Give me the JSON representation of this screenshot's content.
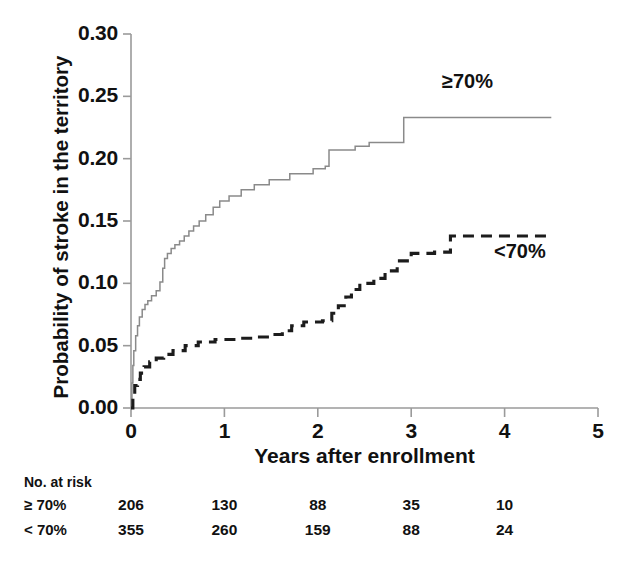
{
  "chart_data": {
    "type": "line",
    "subtype": "kaplan-meier-step",
    "title": "",
    "xlabel": "Years after enrollment",
    "ylabel": "Probability of stroke in the territory",
    "xlim": [
      0,
      5
    ],
    "ylim": [
      0.0,
      0.3
    ],
    "xticks": [
      "0",
      "1",
      "2",
      "3",
      "4",
      "5"
    ],
    "xtick_values": [
      0,
      1,
      2,
      3,
      4,
      5
    ],
    "yticks": [
      "0.00",
      "0.05",
      "0.10",
      "0.15",
      "0.20",
      "0.25",
      "0.30"
    ],
    "ytick_values": [
      0.0,
      0.05,
      0.1,
      0.15,
      0.2,
      0.25,
      0.3
    ],
    "grid": false,
    "legend_position": "in-plot-annotations",
    "series": [
      {
        "name": "≥70%",
        "label": "≥70%",
        "style": "solid",
        "color": "#8a8a8a",
        "annotation_label": "≥70%",
        "points": [
          [
            0.0,
            0.0
          ],
          [
            0.01,
            0.02
          ],
          [
            0.02,
            0.034
          ],
          [
            0.03,
            0.046
          ],
          [
            0.05,
            0.058
          ],
          [
            0.07,
            0.066
          ],
          [
            0.09,
            0.073
          ],
          [
            0.12,
            0.079
          ],
          [
            0.15,
            0.083
          ],
          [
            0.18,
            0.086
          ],
          [
            0.22,
            0.09
          ],
          [
            0.27,
            0.094
          ],
          [
            0.31,
            0.101
          ],
          [
            0.34,
            0.112
          ],
          [
            0.36,
            0.12
          ],
          [
            0.39,
            0.124
          ],
          [
            0.43,
            0.128
          ],
          [
            0.47,
            0.131
          ],
          [
            0.52,
            0.134
          ],
          [
            0.57,
            0.138
          ],
          [
            0.62,
            0.142
          ],
          [
            0.67,
            0.146
          ],
          [
            0.73,
            0.15
          ],
          [
            0.8,
            0.155
          ],
          [
            0.88,
            0.161
          ],
          [
            0.95,
            0.166
          ],
          [
            1.05,
            0.17
          ],
          [
            1.18,
            0.175
          ],
          [
            1.32,
            0.179
          ],
          [
            1.48,
            0.183
          ],
          [
            1.7,
            0.188
          ],
          [
            1.95,
            0.192
          ],
          [
            2.08,
            0.194
          ],
          [
            2.12,
            0.207
          ],
          [
            2.4,
            0.21
          ],
          [
            2.55,
            0.213
          ],
          [
            2.92,
            0.233
          ],
          [
            4.5,
            0.233
          ]
        ]
      },
      {
        "name": "<70%",
        "label": "<70%",
        "style": "dashed",
        "color": "#1c1c1c",
        "annotation_label": "<70%",
        "points": [
          [
            0.0,
            0.0
          ],
          [
            0.02,
            0.01
          ],
          [
            0.04,
            0.018
          ],
          [
            0.07,
            0.023
          ],
          [
            0.1,
            0.028
          ],
          [
            0.14,
            0.033
          ],
          [
            0.2,
            0.037
          ],
          [
            0.27,
            0.04
          ],
          [
            0.35,
            0.043
          ],
          [
            0.45,
            0.046
          ],
          [
            0.58,
            0.05
          ],
          [
            0.72,
            0.053
          ],
          [
            0.9,
            0.055
          ],
          [
            1.15,
            0.056
          ],
          [
            1.35,
            0.057
          ],
          [
            1.52,
            0.059
          ],
          [
            1.62,
            0.062
          ],
          [
            1.72,
            0.066
          ],
          [
            1.85,
            0.069
          ],
          [
            2.05,
            0.07
          ],
          [
            2.15,
            0.076
          ],
          [
            2.22,
            0.082
          ],
          [
            2.3,
            0.089
          ],
          [
            2.36,
            0.095
          ],
          [
            2.45,
            0.1
          ],
          [
            2.6,
            0.104
          ],
          [
            2.72,
            0.11
          ],
          [
            2.85,
            0.118
          ],
          [
            3.0,
            0.124
          ],
          [
            3.25,
            0.125
          ],
          [
            3.42,
            0.138
          ],
          [
            4.5,
            0.138
          ]
        ]
      }
    ],
    "risk_table": {
      "caption": "No. at risk",
      "time_points": [
        0,
        1,
        2,
        3,
        4
      ],
      "rows": [
        {
          "label": "≥ 70%",
          "values": [
            "206",
            "130",
            "88",
            "35",
            "10"
          ]
        },
        {
          "label": "< 70%",
          "values": [
            "355",
            "260",
            "159",
            "88",
            "24"
          ]
        }
      ]
    }
  }
}
